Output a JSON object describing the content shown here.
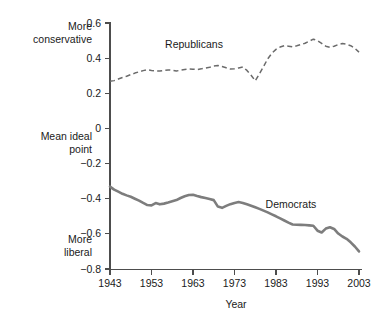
{
  "chart_data": {
    "type": "line",
    "title": "",
    "xlabel": "Year",
    "ylabel": "Mean ideal point",
    "xlim": [
      1943,
      2003
    ],
    "ylim": [
      -0.8,
      0.6
    ],
    "grid": false,
    "legend": "inline-annotations",
    "x_ticks": [
      "1943",
      "1953",
      "1963",
      "1973",
      "1983",
      "1993",
      "2003"
    ],
    "x_tick_values": [
      1943,
      1953,
      1963,
      1973,
      1983,
      1993,
      2003
    ],
    "y_ticks": [
      "0.6",
      "0.4",
      "0.2",
      "0",
      "−0.2",
      "−0.4",
      "−0.6",
      "−0.8"
    ],
    "y_tick_values": [
      0.6,
      0.4,
      0.2,
      0,
      -0.2,
      -0.4,
      -0.6,
      -0.8
    ],
    "annotations": [
      {
        "text": "More conservative",
        "position": "left-upper"
      },
      {
        "text": "Mean ideal point",
        "position": "left-middle"
      },
      {
        "text": "More liberal",
        "position": "left-lower"
      },
      {
        "text": "Republicans",
        "position": "inline-upper-series"
      },
      {
        "text": "Democrats",
        "position": "inline-lower-series"
      }
    ],
    "x": [
      1943,
      1944,
      1945,
      1946,
      1947,
      1948,
      1949,
      1950,
      1951,
      1952,
      1953,
      1954,
      1955,
      1956,
      1957,
      1958,
      1959,
      1960,
      1961,
      1962,
      1963,
      1964,
      1965,
      1966,
      1967,
      1968,
      1969,
      1970,
      1971,
      1972,
      1973,
      1974,
      1975,
      1976,
      1977,
      1978,
      1979,
      1980,
      1981,
      1982,
      1983,
      1984,
      1985,
      1986,
      1987,
      1988,
      1989,
      1990,
      1991,
      1992,
      1993,
      1994,
      1995,
      1996,
      1997,
      1998,
      1999,
      2000,
      2001,
      2002,
      2003
    ],
    "series": [
      {
        "name": "Republicans",
        "style": "dashed",
        "color": "#6b6b6b",
        "values": [
          0.268,
          0.272,
          0.281,
          0.29,
          0.297,
          0.306,
          0.315,
          0.322,
          0.329,
          0.335,
          0.33,
          0.327,
          0.327,
          0.33,
          0.333,
          0.331,
          0.327,
          0.331,
          0.335,
          0.338,
          0.337,
          0.335,
          0.339,
          0.344,
          0.348,
          0.355,
          0.358,
          0.352,
          0.345,
          0.338,
          0.34,
          0.344,
          0.35,
          0.33,
          0.303,
          0.271,
          0.311,
          0.352,
          0.396,
          0.428,
          0.45,
          0.463,
          0.471,
          0.468,
          0.464,
          0.47,
          0.477,
          0.485,
          0.496,
          0.508,
          0.5,
          0.484,
          0.468,
          0.462,
          0.468,
          0.477,
          0.483,
          0.479,
          0.471,
          0.456,
          0.434
        ]
      },
      {
        "name": "Democrats",
        "style": "solid",
        "color": "#7d7d7d",
        "values": [
          -0.331,
          -0.348,
          -0.36,
          -0.372,
          -0.381,
          -0.389,
          -0.4,
          -0.411,
          -0.424,
          -0.436,
          -0.438,
          -0.425,
          -0.432,
          -0.428,
          -0.422,
          -0.415,
          -0.408,
          -0.396,
          -0.386,
          -0.379,
          -0.378,
          -0.385,
          -0.391,
          -0.396,
          -0.402,
          -0.408,
          -0.445,
          -0.452,
          -0.441,
          -0.431,
          -0.424,
          -0.419,
          -0.424,
          -0.432,
          -0.44,
          -0.449,
          -0.458,
          -0.468,
          -0.478,
          -0.489,
          -0.5,
          -0.512,
          -0.524,
          -0.536,
          -0.547,
          -0.548,
          -0.549,
          -0.55,
          -0.552,
          -0.554,
          -0.582,
          -0.592,
          -0.57,
          -0.562,
          -0.572,
          -0.598,
          -0.615,
          -0.628,
          -0.648,
          -0.672,
          -0.7
        ]
      }
    ]
  },
  "labels": {
    "more_conservative_line1": "More",
    "more_conservative_line2": "conservative",
    "mean_ideal_line1": "Mean ideal",
    "mean_ideal_line2": "point",
    "more_liberal_line1": "More",
    "more_liberal_line2": "liberal",
    "republicans": "Republicans",
    "democrats": "Democrats",
    "xaxis_title": "Year"
  }
}
